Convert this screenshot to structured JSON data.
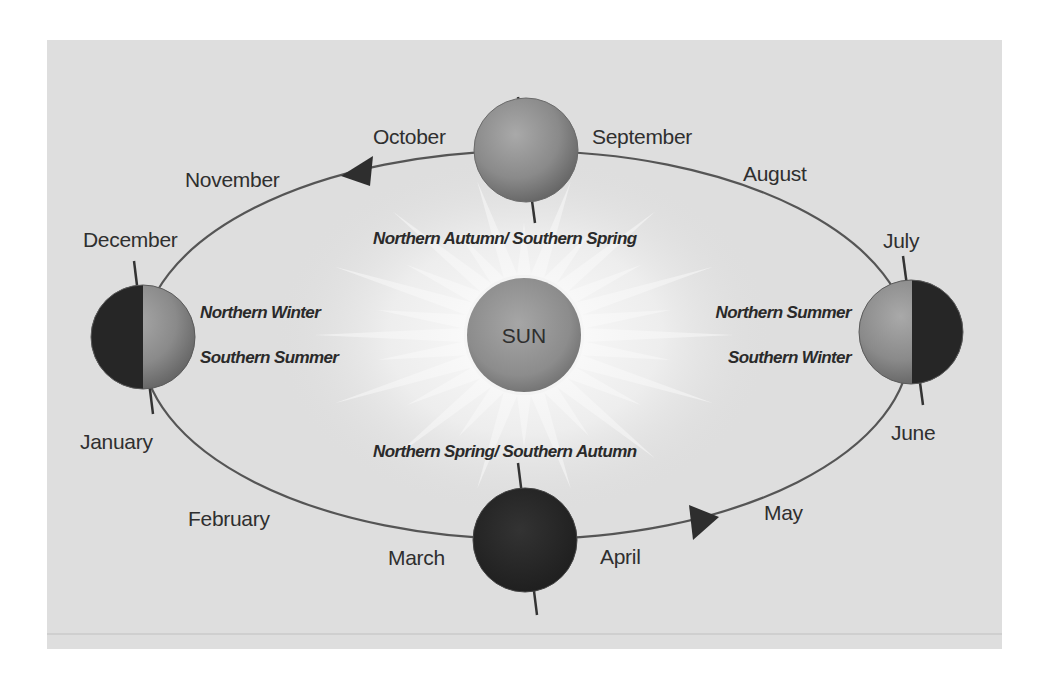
{
  "diagram": {
    "frame": {
      "x": 47,
      "y": 40,
      "width": 955,
      "height": 609,
      "background": "#dedede"
    },
    "colors": {
      "orbit": "#555555",
      "arrow": "#2e2e2e",
      "text": "#2f2f2f",
      "sun_fill": "#8e8e8e",
      "planet_lit": "#8f8f8f",
      "planet_dark": "#262626",
      "axis": "#333333",
      "rays": "#f6f6f6"
    },
    "sun": {
      "label": "SUN",
      "cx": 524,
      "cy": 335,
      "r": 57
    },
    "orbit": {
      "cx": 526,
      "cy": 345,
      "rx": 384,
      "ry": 194,
      "direction": "counter-clockwise (arrows: top pointing left, bottom pointing right)"
    },
    "planets": [
      {
        "id": "top",
        "position": "Sept/Oct",
        "cx": 526,
        "cy": 150,
        "r": 52,
        "phase": "full-lit",
        "axis": [
          518,
          97,
          535,
          223
        ]
      },
      {
        "id": "left",
        "position": "Dec/Jan",
        "cx": 143,
        "cy": 337,
        "r": 52,
        "phase": "left-dark",
        "axis": [
          134,
          261,
          153,
          414
        ]
      },
      {
        "id": "right",
        "position": "June/July",
        "cx": 911,
        "cy": 332,
        "r": 52,
        "phase": "right-dark",
        "axis": [
          903,
          256,
          923,
          405
        ]
      },
      {
        "id": "bottom",
        "position": "Mar/Apr",
        "cx": 525,
        "cy": 540,
        "r": 52,
        "phase": "full-dark",
        "axis": [
          518,
          463,
          537,
          615
        ]
      }
    ],
    "months": [
      {
        "label": "October",
        "x": 373,
        "y": 144
      },
      {
        "label": "September",
        "x": 592,
        "y": 144
      },
      {
        "label": "November",
        "x": 185,
        "y": 187
      },
      {
        "label": "August",
        "x": 743,
        "y": 181
      },
      {
        "label": "December",
        "x": 83,
        "y": 247
      },
      {
        "label": "July",
        "x": 883,
        "y": 248
      },
      {
        "label": "January",
        "x": 80,
        "y": 449
      },
      {
        "label": "June",
        "x": 891,
        "y": 440
      },
      {
        "label": "February",
        "x": 188,
        "y": 526
      },
      {
        "label": "May",
        "x": 764,
        "y": 520
      },
      {
        "label": "March",
        "x": 388,
        "y": 565
      },
      {
        "label": "April",
        "x": 600,
        "y": 564
      }
    ],
    "seasons": [
      {
        "label": "Northern Autumn/ Southern Spring",
        "x": 373,
        "y": 244,
        "anchor": "start"
      },
      {
        "label": "Northern Winter",
        "x": 200,
        "y": 318,
        "anchor": "start"
      },
      {
        "label": "Southern Summer",
        "x": 200,
        "y": 363,
        "anchor": "start"
      },
      {
        "label": "Northern Summer",
        "x": 851,
        "y": 318,
        "anchor": "end"
      },
      {
        "label": "Southern Winter",
        "x": 851,
        "y": 363,
        "anchor": "end"
      },
      {
        "label": "Northern Spring/ Southern Autumn",
        "x": 373,
        "y": 457,
        "anchor": "start"
      }
    ],
    "arrows": [
      {
        "id": "top-arrow",
        "points": "341,176 373,156 370,186",
        "direction": "left"
      },
      {
        "id": "bottom-arrow",
        "points": "719,517 689,505 693,540",
        "direction": "right"
      }
    ]
  }
}
